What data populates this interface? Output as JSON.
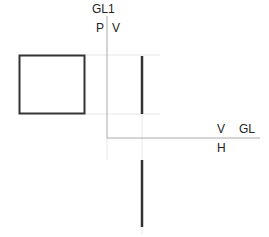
{
  "diagram": {
    "type": "orthographic-projection",
    "labels": {
      "gl1": "GL1",
      "p": "P",
      "v_top": "V",
      "v_right": "V",
      "gl": "GL",
      "h": "H"
    },
    "colors": {
      "thick_line": "#333333",
      "axis_line": "#aaaaaa",
      "projection_line": "#e6e6e6"
    },
    "shapes": {
      "profile_view_square": {
        "x": 19,
        "y": 55,
        "width": 66,
        "height": 59
      },
      "front_view_edge": {
        "x": 142,
        "y1": 56,
        "y2": 114
      },
      "top_view_edge": {
        "x": 142,
        "y1": 160,
        "y2": 227
      },
      "gl1_axis": {
        "x": 107,
        "y1": 16,
        "y2": 138
      },
      "gl_axis": {
        "y": 138,
        "x1": 107,
        "x2": 260
      }
    }
  }
}
